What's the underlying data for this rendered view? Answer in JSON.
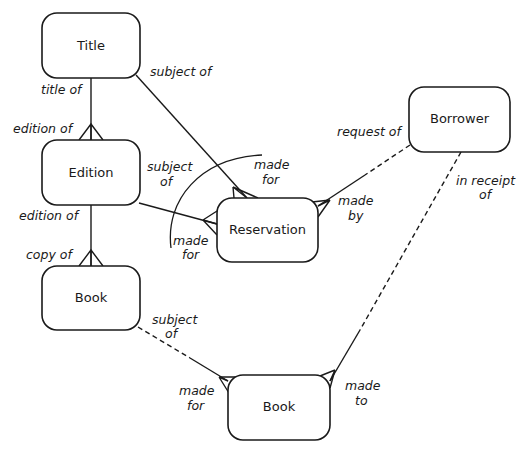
{
  "diagram": {
    "type": "entity-relationship",
    "colors": {
      "stroke": "#1a1a1a",
      "background": "#ffffff"
    },
    "entities": [
      {
        "id": "title",
        "label": "Title"
      },
      {
        "id": "edition",
        "label": "Edition"
      },
      {
        "id": "book_copy",
        "label": "Book"
      },
      {
        "id": "reservation",
        "label": "Reservation"
      },
      {
        "id": "borrower",
        "label": "Borrower"
      },
      {
        "id": "book_loan",
        "label": "Book"
      }
    ],
    "relationships": [
      {
        "from": "title",
        "to": "edition",
        "from_role": "title of",
        "to_role": "edition of",
        "style": "solid",
        "to_many": true
      },
      {
        "from": "edition",
        "to": "book_copy",
        "from_role": "edition of",
        "to_role": "copy of",
        "style": "solid",
        "to_many": true
      },
      {
        "from": "title",
        "to": "reservation",
        "from_role": "subject of",
        "to_role": "made for",
        "style": "solid",
        "to_many": true
      },
      {
        "from": "edition",
        "to": "reservation",
        "from_role": "subject of",
        "to_role": "made for",
        "style": "solid",
        "to_many": true
      },
      {
        "from": "borrower",
        "to": "reservation",
        "from_role": "request of",
        "to_role": "made by",
        "style": "dashed-solid",
        "to_many": true
      },
      {
        "from": "book_copy",
        "to": "book_loan",
        "from_role": "subject of",
        "to_role": "made for",
        "style": "dashed-solid",
        "to_many": true
      },
      {
        "from": "borrower",
        "to": "book_loan",
        "from_role": "in receipt of",
        "to_role": "made to",
        "style": "dashed-solid",
        "to_many": true
      }
    ],
    "labels": {
      "title_of": "title of",
      "edition_of_upper": "edition of",
      "edition_of_lower": "edition of",
      "copy_of": "copy of",
      "subject_of_title": "subject of",
      "subject_of_edition_1": "subject",
      "subject_of_edition_2": "of",
      "made_for_top_1": "made",
      "made_for_top_2": "for",
      "made_for_left_1": "made",
      "made_for_left_2": "for",
      "request_of": "request of",
      "made_by_1": "made",
      "made_by_2": "by",
      "in_receipt_of_1": "in receipt",
      "in_receipt_of_2": "of",
      "subject_of_book_1": "subject",
      "subject_of_book_2": "of",
      "made_for_book_1": "made",
      "made_for_book_2": "for",
      "made_to_1": "made",
      "made_to_2": "to"
    },
    "exclusive_arc": true
  }
}
